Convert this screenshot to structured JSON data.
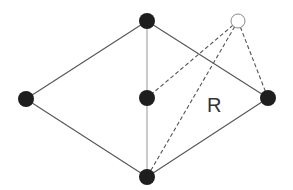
{
  "diagram": {
    "nodes": {
      "top": {
        "x": 147,
        "y": 21,
        "type": "filled"
      },
      "left": {
        "x": 26,
        "y": 99,
        "type": "filled"
      },
      "center": {
        "x": 147,
        "y": 98,
        "type": "filled"
      },
      "right": {
        "x": 268,
        "y": 98,
        "type": "filled"
      },
      "bottom": {
        "x": 147,
        "y": 177,
        "type": "filled"
      },
      "new": {
        "x": 238,
        "y": 21,
        "type": "hollow"
      }
    },
    "solid_edges": [
      [
        "top",
        "left"
      ],
      [
        "top",
        "right"
      ],
      [
        "left",
        "bottom"
      ],
      [
        "right",
        "bottom"
      ]
    ],
    "light_edges": [
      [
        "top",
        "center"
      ],
      [
        "center",
        "bottom"
      ]
    ],
    "dashed_edges": [
      [
        "new",
        "center"
      ],
      [
        "new",
        "bottom"
      ],
      [
        "new",
        "right"
      ]
    ],
    "region_label": "R",
    "colors": {
      "node_fill": "#1e1e1e",
      "edge": "#555555",
      "hollow_stroke": "#8a8a8a"
    }
  }
}
